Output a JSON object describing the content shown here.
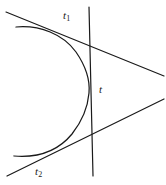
{
  "figure": {
    "type": "geometric-diagram",
    "background_color": "#ffffff",
    "stroke_color": "#1a1a1a",
    "width": 166,
    "height": 185,
    "labels": [
      {
        "id": "t1",
        "base": "t",
        "subscript": "1",
        "x": 63,
        "y": 10
      },
      {
        "id": "t",
        "base": "t",
        "subscript": "",
        "x": 99,
        "y": 84
      },
      {
        "id": "t2",
        "base": "t",
        "subscript": "2",
        "x": 35,
        "y": 166
      }
    ],
    "strokes": {
      "curve": {
        "name": "open-curve",
        "path": "M 16 27 C 40 25 63 34 76 52 C 87 68 90 82 89 93 C 88 105 83 120 72 134 C 58 151 38 158 14 156",
        "stroke_width": 1.25
      },
      "tangent_upper": {
        "name": "tangent-line-t1",
        "x1": 6,
        "y1": 12,
        "x2": 164,
        "y2": 76,
        "stroke_width": 1.2
      },
      "tangent_lower": {
        "name": "tangent-line-t2",
        "x1": 7,
        "y1": 176,
        "x2": 164,
        "y2": 99,
        "stroke_width": 1.2
      },
      "vertical": {
        "name": "vertical-line-t",
        "x1": 89,
        "y1": 7,
        "x2": 93,
        "y2": 176,
        "stroke_width": 1.2
      }
    }
  }
}
